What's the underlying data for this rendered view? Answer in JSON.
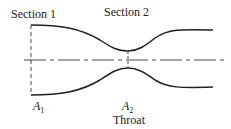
{
  "labels": {
    "section1": "Section 1",
    "section2": "Section 2",
    "a1_base": "A",
    "a1_sub": "1",
    "a2_base": "A",
    "a2_sub": "2",
    "throat": "Throat"
  },
  "colors": {
    "line": "#222222",
    "background": "#ffffff"
  }
}
